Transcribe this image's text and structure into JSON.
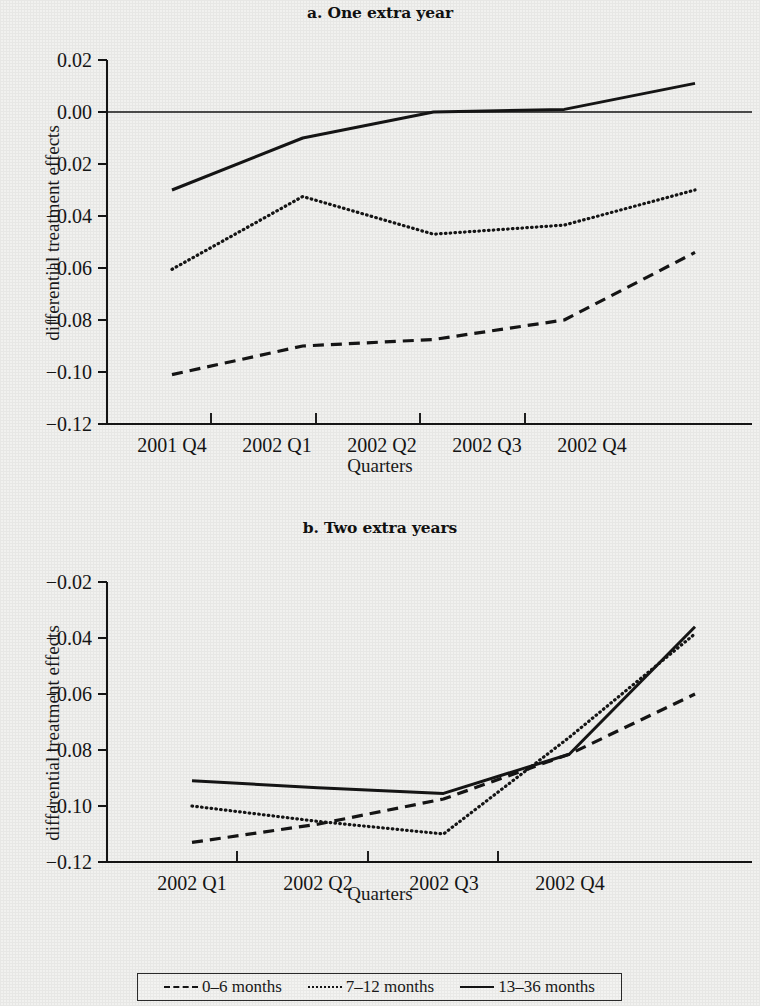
{
  "figure": {
    "background_color": "#f1f1ef",
    "ink_color": "#151515"
  },
  "panel_a": {
    "title": "a. One extra year",
    "ylabel": "differential treatment effects",
    "xlabel": "Quarters"
  },
  "panel_b": {
    "title": "b. Two extra years",
    "ylabel": "differential treatment effects",
    "xlabel": "Quarters"
  },
  "legend": {
    "items": [
      {
        "label": "0–6 months",
        "style": "dashed"
      },
      {
        "label": "7–12 months",
        "style": "dotted"
      },
      {
        "label": "13–36 months",
        "style": "solid"
      }
    ]
  },
  "chart_data": [
    {
      "id": "panel_a",
      "type": "line",
      "title": "a. One extra year",
      "xlabel": "Quarters",
      "ylabel": "differential treatment effects",
      "categories": [
        "2001 Q4",
        "2002 Q1",
        "2002 Q2",
        "2002 Q3",
        "2002 Q4"
      ],
      "x": [
        0,
        1,
        2,
        3,
        4
      ],
      "ylim": [
        -0.12,
        0.02
      ],
      "yticks": [
        0.02,
        0.0,
        -0.02,
        -0.04,
        -0.06,
        -0.08,
        -0.1,
        -0.12
      ],
      "ytick_labels": [
        "0.02",
        "0.00",
        "−0.02",
        "−0.04",
        "−0.06",
        "−0.08",
        "−0.10",
        "−0.12"
      ],
      "grid": false,
      "zero_line": true,
      "legend_position": "below figure",
      "series": [
        {
          "name": "0–6 months",
          "style": "dashed",
          "values": [
            -0.101,
            -0.09,
            -0.0875,
            -0.08,
            -0.054
          ]
        },
        {
          "name": "7–12 months",
          "style": "dotted",
          "values": [
            -0.0605,
            -0.0325,
            -0.047,
            -0.0435,
            -0.03
          ]
        },
        {
          "name": "13–36 months",
          "style": "solid",
          "values": [
            -0.03,
            -0.01,
            0.0,
            0.001,
            0.011
          ]
        }
      ]
    },
    {
      "id": "panel_b",
      "type": "line",
      "title": "b. Two extra years",
      "xlabel": "Quarters",
      "ylabel": "differential treatment effects",
      "categories": [
        "2002 Q1",
        "2002 Q2",
        "2002 Q3",
        "2002 Q4"
      ],
      "x": [
        0,
        1,
        2,
        3,
        4
      ],
      "ylim": [
        -0.12,
        -0.02
      ],
      "yticks": [
        -0.02,
        -0.04,
        -0.06,
        -0.08,
        -0.1,
        -0.12
      ],
      "ytick_labels": [
        "−0.02",
        "−0.04",
        "−0.06",
        "−0.08",
        "−0.10",
        "−0.12"
      ],
      "grid": false,
      "zero_line": false,
      "legend_position": "below figure",
      "series": [
        {
          "name": "0–6 months",
          "style": "dashed",
          "values": [
            -0.113,
            -0.1065,
            -0.0975,
            -0.0815,
            -0.06
          ]
        },
        {
          "name": "7–12 months",
          "style": "dotted",
          "values": [
            -0.1,
            -0.1055,
            -0.11,
            -0.0755,
            -0.0385
          ]
        },
        {
          "name": "13–36 months",
          "style": "solid",
          "values": [
            -0.091,
            -0.0935,
            -0.0955,
            -0.0815,
            -0.036
          ]
        }
      ]
    }
  ]
}
